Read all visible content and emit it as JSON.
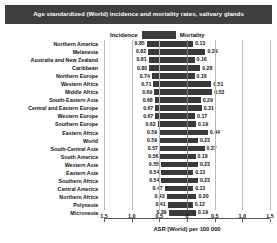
{
  "title": "Age standardized (World) incidence and mortality rates, salivary glands",
  "legend": {
    "incidence": "Incidence",
    "mortality": "Mortality"
  },
  "axis": {
    "title": "ASR (World) per 100 000",
    "ticks": [
      "1.5",
      "1.0",
      "0.5",
      "0",
      "0.5",
      "1.0",
      "1.5"
    ],
    "max": 1.75,
    "grid": true
  },
  "colors": {
    "bar": "#3a3a3a",
    "title_bg": "#3f3f3f",
    "title_fg": "#ffffff"
  },
  "chart_data": {
    "type": "bar",
    "title": "Age standardized (World) incidence and mortality rates, salivary glands",
    "xlabel": "ASR (World) per 100 000",
    "ylabel": "",
    "orientation": "horizontal-diverging",
    "xlim": [
      -1.75,
      1.75
    ],
    "categories": [
      "Northern America",
      "Melanesia",
      "Australia and New Zealand",
      "Caribbean",
      "Northern Europe",
      "Western Africa",
      "Middle Africa",
      "South-Eastern Asia",
      "Central and Eastern Europe",
      "Western Europe",
      "Southern Europe",
      "Eastern Africa",
      "World",
      "South-Central Asia",
      "South America",
      "Western Asia",
      "Eastern Asia",
      "Southern Africa",
      "Central America",
      "Northern Africa",
      "Polynesia",
      "Micronesia"
    ],
    "series": [
      {
        "name": "Incidence",
        "direction": "left",
        "values": [
          0.85,
          0.82,
          0.81,
          0.8,
          0.74,
          0.71,
          0.69,
          0.68,
          0.67,
          0.67,
          0.62,
          0.59,
          0.59,
          0.57,
          0.56,
          0.55,
          0.54,
          0.54,
          0.47,
          0.43,
          0.41,
          0.39
        ]
      },
      {
        "name": "Mortality",
        "direction": "right",
        "values": [
          0.13,
          0.39,
          0.16,
          0.28,
          0.16,
          0.51,
          0.53,
          0.29,
          0.31,
          0.17,
          0.19,
          0.44,
          0.23,
          0.37,
          0.18,
          0.23,
          0.13,
          0.23,
          0.13,
          0.2,
          0.12,
          0.19
        ]
      }
    ]
  }
}
